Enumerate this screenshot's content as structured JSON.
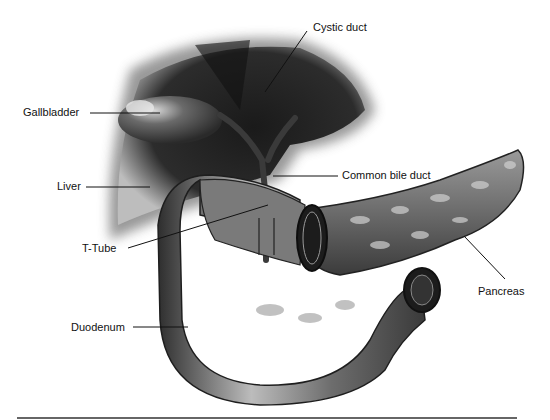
{
  "figure": {
    "labels": {
      "cystic_duct": "Cystic duct",
      "gallbladder": "Gallbladder",
      "common_bile_duct": "Common bile duct",
      "liver": "Liver",
      "t_tube": "T-Tube",
      "pancreas": "Pancreas",
      "duodenum": "Duodenum"
    }
  }
}
